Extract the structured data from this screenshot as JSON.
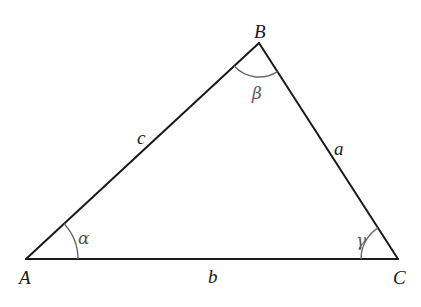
{
  "diagram": {
    "type": "triangle",
    "vertices": [
      {
        "id": "A",
        "label": "A",
        "x": 26,
        "y": 259
      },
      {
        "id": "B",
        "label": "B",
        "x": 259,
        "y": 43
      },
      {
        "id": "C",
        "label": "C",
        "x": 398,
        "y": 259
      }
    ],
    "sides": [
      {
        "id": "a",
        "label": "a",
        "from": "B",
        "to": "C"
      },
      {
        "id": "b",
        "label": "b",
        "from": "A",
        "to": "C"
      },
      {
        "id": "c",
        "label": "c",
        "from": "A",
        "to": "B"
      }
    ],
    "angles": [
      {
        "id": "alpha",
        "label": "α",
        "at": "A"
      },
      {
        "id": "beta",
        "label": "β",
        "at": "B"
      },
      {
        "id": "gamma",
        "label": "γ",
        "at": "C"
      }
    ],
    "colors": {
      "edge": "#1a1a1a",
      "arc": "#6a6a6a",
      "background": "#ffffff"
    }
  }
}
